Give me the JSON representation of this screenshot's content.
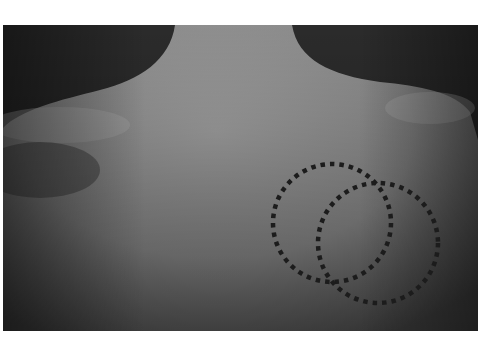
{
  "image": {
    "description": "Grayscale photograph of a person's upper back and shoulders with two overlapping dotted circles marking a region on the right side of the back",
    "colors": {
      "background": "#2a2a2a",
      "skin_light": "#9a9a9a",
      "skin_mid": "#7e7e7e",
      "skin_dark": "#4a4a4a",
      "marker": "#1e1e1e",
      "page": "#ffffff"
    },
    "markers": [
      {
        "id": "circle-1",
        "cx": 332,
        "cy": 223,
        "r": 59,
        "style": "dotted"
      },
      {
        "id": "circle-2",
        "cx": 378,
        "cy": 243,
        "r": 60,
        "style": "dotted"
      }
    ]
  }
}
